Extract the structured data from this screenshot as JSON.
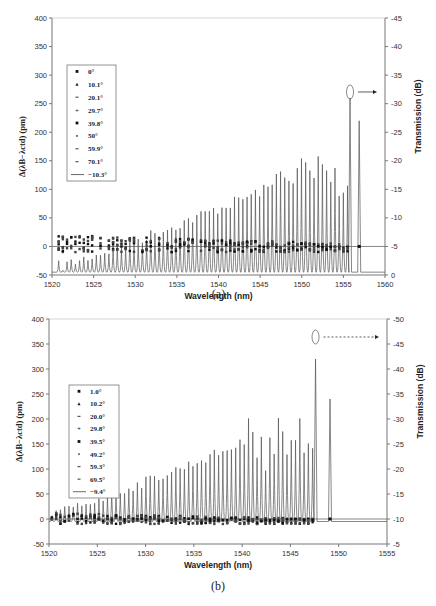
{
  "chart_data": [
    {
      "type": "scatter",
      "panel": "(a)",
      "xlabel": "Wavelength (nm)",
      "ylabel": "Δ(λB−λctd) (pm)",
      "y2label": "Transmission (dB)",
      "xlim": [
        1520,
        1560
      ],
      "ylim": [
        -50,
        400
      ],
      "y2lim": [
        -45,
        0
      ],
      "xticks": [
        "1520",
        "1525",
        "1530",
        "1535",
        "1540",
        "1545",
        "1550",
        "1555",
        "1560"
      ],
      "yticks": [
        "-50",
        "0",
        "50",
        "100",
        "150",
        "200",
        "250",
        "300",
        "350",
        "400"
      ],
      "y2ticks": [
        "0",
        "-5",
        "-10",
        "-15",
        "-20",
        "-25",
        "-30",
        "-35",
        "-40",
        "-45"
      ],
      "legend": [
        "0°",
        "10.1°",
        "20.1°",
        "29.7°",
        "39.8°",
        "50°",
        "59.9°",
        "70.1°",
        "−10.3°"
      ],
      "legend_placement": "left-middle",
      "spectrum": {
        "baseline_db": -0.5,
        "dips_start_nm": 1520.8,
        "dips_end_nm": 1555.5,
        "dip_count": 70,
        "min_depth_db": -1.5,
        "max_depth_db": -21,
        "main_dip": {
          "x": 1555.8,
          "depth_db": -31
        },
        "second_dip": {
          "x": 1556.9,
          "depth_db": -27
        }
      },
      "scatter_range_pm": [
        -10,
        20
      ],
      "annotation": "ellipse at main dip with arrow pointing to right axis"
    },
    {
      "type": "scatter",
      "panel": "(b)",
      "xlabel": "Wavelength (nm)",
      "ylabel": "Δ(λB−λctd) (pm)",
      "y2label": "Transmission (dB)",
      "xlim": [
        1520,
        1555
      ],
      "ylim": [
        -50,
        400
      ],
      "y2lim": [
        -50,
        -5
      ],
      "xticks": [
        "1520",
        "1525",
        "1530",
        "1535",
        "1540",
        "1545",
        "1550",
        "1555"
      ],
      "yticks": [
        "-50",
        "0",
        "50",
        "100",
        "150",
        "200",
        "250",
        "300",
        "350",
        "400"
      ],
      "y2ticks": [
        "-5",
        "-10",
        "-15",
        "-20",
        "-25",
        "-30",
        "-35",
        "-40",
        "-45",
        "-50"
      ],
      "legend": [
        "1.0°",
        "10.2°",
        "20.0°",
        "29.8°",
        "39.5°",
        "49.2°",
        "59.3°",
        "69.5°",
        "−9.4°"
      ],
      "legend_placement": "left-middle",
      "spectrum": {
        "baseline_db": -9.5,
        "dips_start_nm": 1520.3,
        "dips_end_nm": 1547.3,
        "dip_count": 62,
        "min_depth_db": -11,
        "max_depth_db": -31,
        "main_dip": {
          "x": 1547.6,
          "depth_db": -42
        },
        "second_dip": {
          "x": 1549.1,
          "depth_db": -34
        }
      },
      "scatter_range_pm": [
        -10,
        12
      ],
      "annotation": "ellipse at main dip with dashed arrow pointing to right axis"
    }
  ]
}
